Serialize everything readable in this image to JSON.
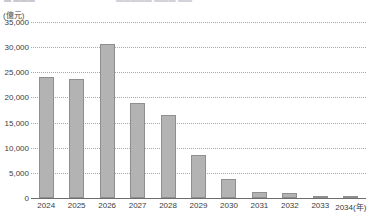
{
  "caption": {
    "left_text": "▬ ▬▬▬",
    "right_text": "▬▬▬▬▬ ▬▬▬ ▬▬"
  },
  "chart_data": {
    "type": "bar",
    "title": "",
    "unit_label": "(億元)",
    "xlabel": "2034(年)",
    "ylabel": "",
    "categories": [
      "2024",
      "2025",
      "2026",
      "2027",
      "2028",
      "2029",
      "2030",
      "2031",
      "2032",
      "2033",
      "2034"
    ],
    "x_tick_labels": [
      "2024",
      "2025",
      "2026",
      "2027",
      "2028",
      "2029",
      "2030",
      "2031",
      "2032",
      "2033",
      "2034(年)"
    ],
    "values": [
      24000,
      23700,
      30700,
      18800,
      16500,
      8500,
      3800,
      1100,
      1000,
      450,
      350
    ],
    "ylim": [
      0,
      35000
    ],
    "y_tick_values": [
      0,
      5000,
      10000,
      15000,
      20000,
      25000,
      30000,
      35000
    ],
    "y_tick_labels": [
      "0",
      "5,000",
      "10,000",
      "15,000",
      "20,000",
      "25,000",
      "30,000",
      "35,000"
    ],
    "grid": true,
    "grid_style": "dotted",
    "legend": null,
    "bar_color": "#b3b3b3",
    "bar_border_color": "#8f8f8f",
    "axis_color": "#6d6d6d",
    "grid_color": "#a8a8a8",
    "text_color": "#3c3c3c"
  }
}
